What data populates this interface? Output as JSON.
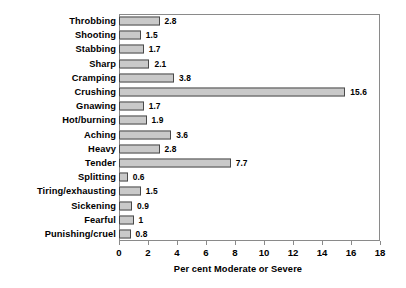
{
  "chart_data": {
    "type": "bar",
    "orientation": "horizontal",
    "title": "",
    "xlabel": "Per cent Moderate or Severe",
    "ylabel": "",
    "xlim": [
      0,
      18
    ],
    "ylim": null,
    "grid": false,
    "legend": null,
    "xticks": [
      0,
      2,
      4,
      6,
      8,
      10,
      12,
      14,
      16,
      18
    ],
    "xtick_labels": [
      "0",
      "2",
      "4",
      "6",
      "8",
      "10",
      "12",
      "14",
      "16",
      "18"
    ],
    "categories": [
      "Throbbing",
      "Shooting",
      "Stabbing",
      "Sharp",
      "Cramping",
      "Crushing",
      "Gnawing",
      "Hot/burning",
      "Aching",
      "Heavy",
      "Tender",
      "Splitting",
      "Tiring/exhausting",
      "Sickening",
      "Fearful",
      "Punishing/cruel"
    ],
    "values": [
      2.8,
      1.5,
      1.7,
      2.1,
      3.8,
      15.6,
      1.7,
      1.9,
      3.6,
      2.8,
      7.7,
      0.6,
      1.5,
      0.9,
      1,
      0.8
    ],
    "value_labels": [
      "2.8",
      "1.5",
      "1.7",
      "2.1",
      "3.8",
      "15.6",
      "1.7",
      "1.9",
      "3.6",
      "2.8",
      "7.7",
      "0.6",
      "1.5",
      "0.9",
      "1",
      "0.8"
    ],
    "colors": {
      "bar_fill": "#c9c9c9",
      "bar_edge": "#4a4a4a",
      "frame": "#8a8a8a",
      "text": "#000000",
      "background": "#ffffff"
    }
  }
}
